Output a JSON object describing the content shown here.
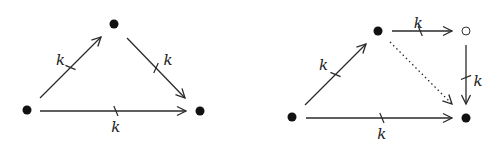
{
  "diagrams": [
    {
      "id": "left-triangle",
      "nodes": [
        {
          "id": "A",
          "style": "filled"
        },
        {
          "id": "B",
          "style": "filled"
        },
        {
          "id": "C",
          "style": "filled"
        }
      ],
      "edges": [
        {
          "from": "A",
          "to": "B",
          "label": "k",
          "marked": true,
          "style": "solid"
        },
        {
          "from": "B",
          "to": "C",
          "label": "k",
          "marked": true,
          "style": "solid"
        },
        {
          "from": "A",
          "to": "C",
          "label": "k",
          "marked": true,
          "style": "solid"
        }
      ]
    },
    {
      "id": "right-square",
      "nodes": [
        {
          "id": "A",
          "style": "filled"
        },
        {
          "id": "B",
          "style": "filled"
        },
        {
          "id": "D",
          "style": "open"
        },
        {
          "id": "C",
          "style": "filled"
        }
      ],
      "edges": [
        {
          "from": "A",
          "to": "B",
          "label": "k",
          "marked": true,
          "style": "solid"
        },
        {
          "from": "B",
          "to": "D",
          "label": "k",
          "marked": true,
          "style": "solid"
        },
        {
          "from": "D",
          "to": "C",
          "label": "k",
          "marked": true,
          "style": "solid"
        },
        {
          "from": "A",
          "to": "C",
          "label": "k",
          "marked": true,
          "style": "solid"
        },
        {
          "from": "B",
          "to": "C",
          "label": "",
          "marked": false,
          "style": "dotted"
        }
      ]
    }
  ]
}
